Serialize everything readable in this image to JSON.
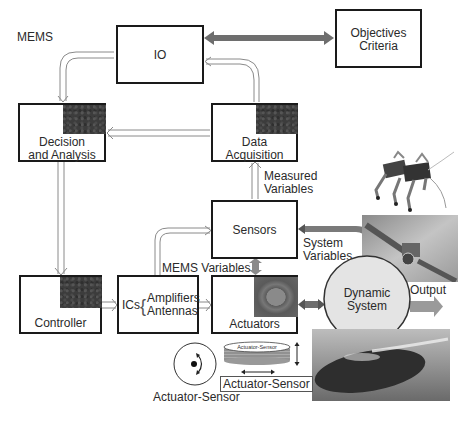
{
  "diagram": {
    "title": "MEMS",
    "boxes": {
      "io": {
        "label": "IO"
      },
      "objectives": {
        "line1": "Objectives",
        "line2": "Criteria"
      },
      "decision": {
        "line1": "Decision",
        "line2": "and Analysis"
      },
      "data_acquisition": {
        "line1": "Data",
        "line2": "Acquisition"
      },
      "sensors": {
        "label": "Sensors"
      },
      "controller": {
        "label": "Controller"
      },
      "ics": {
        "prefix": "ICs",
        "line1": "Amplifiers",
        "line2": "Antennas"
      },
      "actuators": {
        "label": "Actuators"
      },
      "dynamic_system": {
        "line1": "Dynamic",
        "line2": "System"
      }
    },
    "edge_labels": {
      "measured_variables_1": "Measured",
      "measured_variables_2": "Variables",
      "system_variables_1": "System",
      "system_variables_2": "Variables",
      "mems_variables": "MEMS Variables",
      "output": "Output"
    },
    "actuator_sensor": {
      "disk_label": "Actuator-Sensor",
      "stack_label": "Actuator-Sensor",
      "boxed_label": "Actuator-Sensor"
    },
    "images": [
      {
        "name": "robot-insect-image",
        "description": "legged robot"
      },
      {
        "name": "satellite-image",
        "description": "satellite"
      },
      {
        "name": "submarine-image",
        "description": "submarine"
      }
    ],
    "colors": {
      "box_border": "#1a1a1a",
      "dark_patch": "#3c3c3c",
      "thick_arrow": "#6e6e6e",
      "circle_fill": "#e4e4e4",
      "hollow_arrow": "#9a9a9a"
    }
  }
}
